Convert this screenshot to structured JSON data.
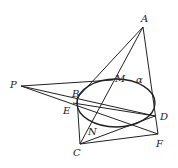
{
  "diagram": {
    "title": "",
    "colors": {
      "stroke": "#222222",
      "background": "#ffffff"
    },
    "points": {
      "A": {
        "label": "A",
        "x": 143,
        "y": 27,
        "lx": 141,
        "ly": 22
      },
      "P": {
        "label": "P",
        "x": 21,
        "y": 86,
        "lx": 10,
        "ly": 88
      },
      "B": {
        "label": "B",
        "x": 77,
        "y": 98,
        "lx": 72,
        "ly": 97
      },
      "E": {
        "label": "E",
        "x": 73,
        "y": 103,
        "lx": 63,
        "ly": 114
      },
      "M": {
        "label": "M",
        "x": 113,
        "y": 80,
        "lx": 115,
        "ly": 82
      },
      "D": {
        "label": "D",
        "x": 155,
        "y": 116,
        "lx": 160,
        "ly": 120
      },
      "F": {
        "label": "F",
        "x": 158,
        "y": 134,
        "lx": 156,
        "ly": 147
      },
      "C": {
        "label": "C",
        "x": 80,
        "y": 144,
        "lx": 73,
        "ly": 156
      },
      "N": {
        "label": "N",
        "x": 93,
        "y": 124,
        "lx": 88,
        "ly": 135
      }
    },
    "plane_label": {
      "text": "α",
      "x": 136,
      "y": 83
    },
    "ellipse": {
      "cx": 116,
      "cy": 103,
      "rx": 39,
      "ry": 24
    }
  }
}
